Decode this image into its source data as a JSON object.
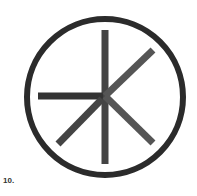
{
  "figure": {
    "label": "10.",
    "symbol": "circle-with-radial-lines-icon",
    "colors": {
      "stroke": "#2b2b2b",
      "spoke": "#444444",
      "background": "#ffffff"
    }
  }
}
